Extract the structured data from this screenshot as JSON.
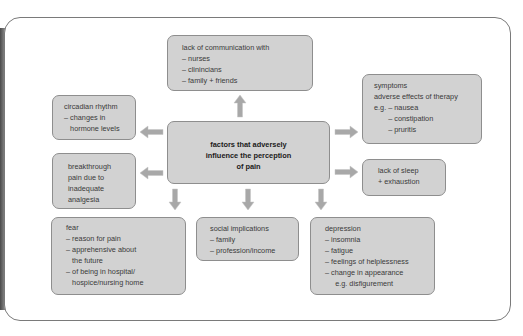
{
  "diagram": {
    "center": {
      "lines": [
        "factors that adversely",
        "influence the perception",
        "of pain"
      ]
    },
    "nodes": {
      "communication": {
        "lines": [
          "lack of communication with",
          "– nurses",
          "– clinincians",
          "– family + friends"
        ]
      },
      "symptoms": {
        "lines": [
          "symptoms",
          "adverse effects of therapy",
          "e.g. – nausea",
          "       – constipation",
          "       – pruritis"
        ]
      },
      "sleep": {
        "lines": [
          "lack of sleep",
          "+ exhaustion"
        ]
      },
      "circadian": {
        "lines": [
          "circadian rhythm",
          "– changes in",
          "   hormone levels"
        ]
      },
      "breakthrough": {
        "lines": [
          "breakthrough",
          "pain due to",
          "inadequate",
          "analgesia"
        ]
      },
      "fear": {
        "lines": [
          "fear",
          "– reason for pain",
          "– apprehensive about",
          "   the future",
          "– of being in hospital/",
          "   hospice/nursing home"
        ]
      },
      "social": {
        "lines": [
          "social implications",
          "– family",
          "– profession/income"
        ]
      },
      "depression": {
        "lines": [
          "depression",
          "– insomnia",
          "– fatigue",
          "– feelings of helplessness",
          "– change in appearance",
          "     e.g. disfigurement"
        ]
      }
    },
    "colors": {
      "box_fill": "#d2d2d2",
      "box_border": "#8e8e8e",
      "arrow": "#a8a8a8",
      "text": "#3a3a3a"
    }
  }
}
